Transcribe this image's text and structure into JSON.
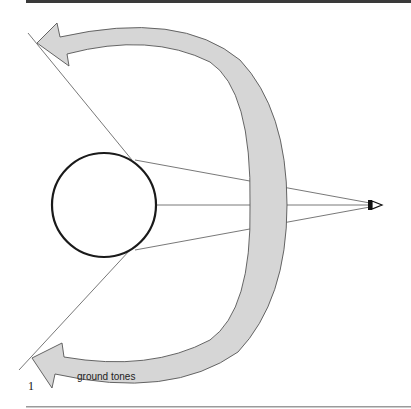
{
  "figure": {
    "number": "1",
    "arrow_label": "ground tones",
    "colors": {
      "band_fill": "#d6d6d6",
      "band_stroke": "#555555",
      "line": "#555555",
      "circle": "#1a1a1a",
      "top_rule": "#3a3a3a",
      "bottom_rule": "#9a9a9a"
    }
  }
}
